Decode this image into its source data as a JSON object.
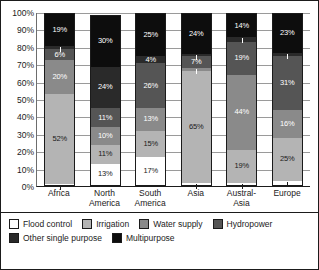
{
  "chart_data": {
    "type": "bar",
    "stacked": true,
    "title": "",
    "xlabel": "",
    "ylabel": "",
    "ylim": [
      0,
      100
    ],
    "grid": true,
    "legend_position": "bottom",
    "categories": [
      "Africa",
      "North America",
      "South America",
      "Asia",
      "Austral-Asia",
      "Europe"
    ],
    "category_labels": [
      [
        "Africa"
      ],
      [
        "North",
        "America"
      ],
      [
        "South",
        "America"
      ],
      [
        "Asia"
      ],
      [
        "Austral-",
        "Asia"
      ],
      [
        "Europe"
      ]
    ],
    "y_ticks": [
      "0%",
      "10%",
      "20%",
      "30%",
      "40%",
      "50%",
      "60%",
      "70%",
      "80%",
      "90%",
      "100%"
    ],
    "series": [
      {
        "name": "Flood control",
        "color": "#ffffff",
        "text_color": "#1b1b1b",
        "values": [
          1,
          13,
          17,
          2,
          2,
          3
        ],
        "labels": [
          "1%",
          "13%",
          "17%",
          "2%",
          "2%",
          "3%"
        ]
      },
      {
        "name": "Irrigation",
        "color": "#b4b4b4",
        "text_color": "#1b1b1b",
        "values": [
          52,
          11,
          15,
          65,
          19,
          25
        ],
        "labels": [
          "52%",
          "11%",
          "15%",
          "65%",
          "19%",
          "25%"
        ]
      },
      {
        "name": "Water supply",
        "color": "#8a8a8a",
        "text_color": "#ffffff",
        "values": [
          20,
          10,
          13,
          2,
          44,
          16
        ],
        "labels": [
          "20%",
          "10%",
          "13%",
          "2%",
          "44%",
          "16%"
        ]
      },
      {
        "name": "Hydropower",
        "color": "#555555",
        "text_color": "#ffffff",
        "values": [
          6,
          11,
          26,
          7,
          19,
          31
        ],
        "labels": [
          "6%",
          "11%",
          "26%",
          "7%",
          "19%",
          "31%"
        ]
      },
      {
        "name": "Other single purpose",
        "color": "#2a2a2a",
        "text_color": "#ffffff",
        "values": [
          2,
          24,
          4,
          1,
          3,
          2
        ],
        "labels": [
          "2%",
          "24%",
          "4%",
          "1%",
          "3%",
          "2%"
        ]
      },
      {
        "name": "Multipurpose",
        "color": "#0d0d0d",
        "text_color": "#ffffff",
        "values": [
          19,
          30,
          25,
          24,
          14,
          23
        ],
        "labels": [
          "19%",
          "30%",
          "25%",
          "24%",
          "14%",
          "23%"
        ]
      }
    ]
  }
}
